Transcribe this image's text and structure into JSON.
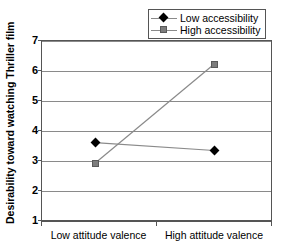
{
  "chart_data": {
    "type": "line",
    "title": "",
    "xlabel": "",
    "ylabel": "Desirability toward watching Thriller film",
    "categories": [
      "Low attitude valence",
      "High attitude valence"
    ],
    "ylim": [
      1,
      7
    ],
    "yticks": [
      1,
      2,
      3,
      4,
      5,
      6,
      7
    ],
    "ytick_labels": [
      "1",
      "2",
      "3",
      "4",
      "5",
      "6",
      "7"
    ],
    "grid": true,
    "grid_axis": "y",
    "legend_position": "top-right",
    "series": [
      {
        "name": "Low accessibility",
        "values": [
          3.63,
          3.37
        ],
        "marker": "diamond",
        "color": "#000000",
        "line_color": "#8a8a8a"
      },
      {
        "name": "High accessibility",
        "values": [
          2.95,
          6.23
        ],
        "marker": "square",
        "color": "#7d7d7d",
        "line_color": "#8a8a8a"
      }
    ]
  },
  "axis": {
    "y_title": "Desirability toward watching Thriller film",
    "y_labels": [
      "7",
      "6",
      "5",
      "4",
      "3",
      "2",
      "1"
    ],
    "x_labels": [
      "Low attitude valence",
      "High attitude valence"
    ]
  },
  "legend": {
    "items": [
      {
        "label": "Low accessibility",
        "marker": "diamond-marker-icon"
      },
      {
        "label": "High accessibility",
        "marker": "square-marker-icon"
      }
    ]
  },
  "colors": {
    "marker_low": "#000000",
    "marker_high": "#7d7d7d",
    "line": "#8a8a8a",
    "axis": "#555555",
    "grid": "#8a8a8a",
    "background": "#ffffff"
  }
}
